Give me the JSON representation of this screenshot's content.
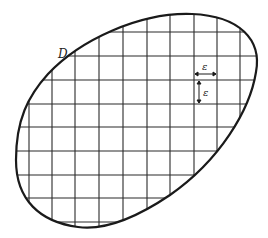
{
  "figure": {
    "region_label": "D",
    "cell_size_label_horizontal": "ε",
    "cell_size_label_vertical": "ε",
    "colors": {
      "ink": "#1a1a1a",
      "grid": "#2a2a2a",
      "background": "#ffffff"
    },
    "grid": {
      "vertical_lines_x": [
        29,
        52,
        75,
        99,
        123,
        147,
        170,
        194,
        217,
        240
      ],
      "horizontal_lines_y": [
        32,
        56,
        80,
        104,
        127,
        151,
        175,
        198,
        222
      ]
    }
  }
}
